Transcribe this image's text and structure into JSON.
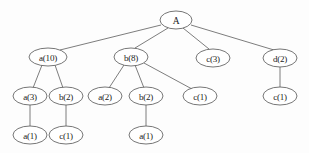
{
  "diagram": {
    "type": "rooted-tree",
    "background_color": "#fdfdfd",
    "node_fill_color": "#ffffff",
    "node_stroke_color": "#5d5d5d",
    "edge_color": "#6e6e6e",
    "label_color": "#1b1b1b"
  },
  "nodes": [
    {
      "id": "root",
      "label": "A",
      "item": "A",
      "count": null,
      "x": 176,
      "y": 20,
      "rx": 16,
      "ry": 9,
      "level": 0
    },
    {
      "id": "n1",
      "label": "a(10)",
      "item": "a",
      "count": 10,
      "x": 48,
      "y": 57,
      "rx": 19,
      "ry": 9,
      "level": 1
    },
    {
      "id": "n2",
      "label": "b(8)",
      "item": "b",
      "count": 8,
      "x": 131,
      "y": 57,
      "rx": 17,
      "ry": 9,
      "level": 1
    },
    {
      "id": "n3",
      "label": "c(3)",
      "item": "c",
      "count": 3,
      "x": 213,
      "y": 58,
      "rx": 17,
      "ry": 9,
      "level": 1
    },
    {
      "id": "n4",
      "label": "d(2)",
      "item": "d",
      "count": 2,
      "x": 280,
      "y": 58,
      "rx": 17,
      "ry": 9,
      "level": 1
    },
    {
      "id": "n5",
      "label": "a(3)",
      "item": "a",
      "count": 3,
      "x": 30,
      "y": 96,
      "rx": 17,
      "ry": 9,
      "level": 2
    },
    {
      "id": "n6",
      "label": "b(2)",
      "item": "b",
      "count": 2,
      "x": 66,
      "y": 96,
      "rx": 17,
      "ry": 9,
      "level": 2
    },
    {
      "id": "n7",
      "label": "a(2)",
      "item": "a",
      "count": 2,
      "x": 105,
      "y": 96,
      "rx": 17,
      "ry": 9,
      "level": 2
    },
    {
      "id": "n8",
      "label": "b(2)",
      "item": "b",
      "count": 2,
      "x": 146,
      "y": 96,
      "rx": 17,
      "ry": 9,
      "level": 2
    },
    {
      "id": "n9",
      "label": "c(1)",
      "item": "c",
      "count": 1,
      "x": 200,
      "y": 96,
      "rx": 17,
      "ry": 9,
      "level": 2
    },
    {
      "id": "n10",
      "label": "c(1)",
      "item": "c",
      "count": 1,
      "x": 280,
      "y": 96,
      "rx": 17,
      "ry": 9,
      "level": 2
    },
    {
      "id": "n11",
      "label": "a(1)",
      "item": "a",
      "count": 1,
      "x": 30,
      "y": 135,
      "rx": 17,
      "ry": 9,
      "level": 3
    },
    {
      "id": "n12",
      "label": "c(1)",
      "item": "c",
      "count": 1,
      "x": 66,
      "y": 135,
      "rx": 17,
      "ry": 9,
      "level": 3
    },
    {
      "id": "n13",
      "label": "a(1)",
      "item": "a",
      "count": 1,
      "x": 146,
      "y": 135,
      "rx": 17,
      "ry": 9,
      "level": 3
    }
  ],
  "edges": [
    {
      "from": "root",
      "to": "n1",
      "x1": 161,
      "y1": 25,
      "x2": 60,
      "y2": 50
    },
    {
      "from": "root",
      "to": "n2",
      "x1": 168,
      "y1": 28,
      "x2": 135,
      "y2": 48
    },
    {
      "from": "root",
      "to": "n3",
      "x1": 183,
      "y1": 28,
      "x2": 209,
      "y2": 49
    },
    {
      "from": "root",
      "to": "n4",
      "x1": 191,
      "y1": 25,
      "x2": 274,
      "y2": 50
    },
    {
      "from": "n1",
      "to": "n5",
      "x1": 42,
      "y1": 65,
      "x2": 33,
      "y2": 88
    },
    {
      "from": "n1",
      "to": "n6",
      "x1": 55,
      "y1": 65,
      "x2": 63,
      "y2": 88
    },
    {
      "from": "n2",
      "to": "n7",
      "x1": 124,
      "y1": 65,
      "x2": 109,
      "y2": 88
    },
    {
      "from": "n2",
      "to": "n8",
      "x1": 135,
      "y1": 65,
      "x2": 144,
      "y2": 88
    },
    {
      "from": "n2",
      "to": "n9",
      "x1": 144,
      "y1": 63,
      "x2": 192,
      "y2": 89
    },
    {
      "from": "n4",
      "to": "n10",
      "x1": 280,
      "y1": 67,
      "x2": 280,
      "y2": 87
    },
    {
      "from": "n5",
      "to": "n11",
      "x1": 30,
      "y1": 105,
      "x2": 30,
      "y2": 126
    },
    {
      "from": "n6",
      "to": "n12",
      "x1": 66,
      "y1": 105,
      "x2": 66,
      "y2": 126
    },
    {
      "from": "n8",
      "to": "n13",
      "x1": 146,
      "y1": 105,
      "x2": 146,
      "y2": 126
    }
  ]
}
